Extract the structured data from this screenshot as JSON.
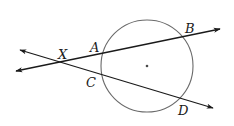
{
  "diagram": {
    "type": "geometry",
    "colors": {
      "line": "#1a1a1a",
      "circle": "#6a6a6a",
      "background": "#ffffff"
    },
    "circle": {
      "cx": 147,
      "cy": 66,
      "r": 46,
      "center_dot": true
    },
    "points": {
      "X": {
        "label": "X",
        "x": 61,
        "y": 62
      },
      "A": {
        "label": "A",
        "x": 102,
        "y": 54
      },
      "B": {
        "label": "B",
        "x": 184,
        "y": 36
      },
      "C": {
        "label": "C",
        "x": 103,
        "y": 75
      },
      "D": {
        "label": "D",
        "x": 180,
        "y": 98
      }
    },
    "lines": [
      {
        "name": "line-ab",
        "through": [
          "X",
          "A",
          "B"
        ],
        "x1": 16,
        "y1": 71,
        "x2": 220,
        "y2": 29,
        "arrows": "both"
      },
      {
        "name": "line-cd",
        "through": [
          "X",
          "C",
          "D"
        ],
        "x1": 20,
        "y1": 50,
        "x2": 213,
        "y2": 108,
        "arrows": "both"
      }
    ],
    "labels": {
      "X": "X",
      "A": "A",
      "B": "B",
      "C": "C",
      "D": "D"
    }
  }
}
